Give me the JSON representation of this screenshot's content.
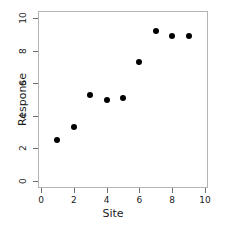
{
  "chart_data": {
    "type": "scatter",
    "title": "",
    "xlabel": "Site",
    "ylabel": "Response",
    "xlim": [
      0,
      10
    ],
    "ylim": [
      0,
      10
    ],
    "xticks": [
      0,
      2,
      4,
      6,
      8,
      10
    ],
    "yticks": [
      0,
      2,
      4,
      6,
      8,
      10
    ],
    "xtick_labels": [
      "0",
      "2",
      "4",
      "6",
      "8",
      "10"
    ],
    "ytick_labels": [
      "0",
      "2",
      "4",
      "6",
      "8",
      "10"
    ],
    "grid": false,
    "legend": null,
    "marker": "filled-circle",
    "marker_color": "#000000",
    "frame_color": "#b4b4b4",
    "points": [
      {
        "x": 1,
        "y": 2.5
      },
      {
        "x": 2,
        "y": 3.3
      },
      {
        "x": 3,
        "y": 5.3
      },
      {
        "x": 4,
        "y": 5.0
      },
      {
        "x": 5,
        "y": 5.1
      },
      {
        "x": 6,
        "y": 7.3
      },
      {
        "x": 7,
        "y": 9.2
      },
      {
        "x": 8,
        "y": 8.9
      },
      {
        "x": 9,
        "y": 8.9
      }
    ],
    "x": [
      1,
      2,
      3,
      4,
      5,
      6,
      7,
      8,
      9
    ],
    "values": [
      2.5,
      3.3,
      5.3,
      5.0,
      5.1,
      7.3,
      9.2,
      8.9,
      8.9
    ]
  }
}
